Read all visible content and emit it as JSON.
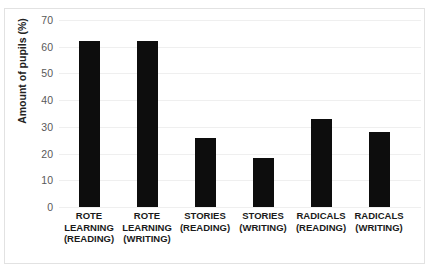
{
  "chart_data": {
    "type": "bar",
    "title": "",
    "xlabel": "",
    "ylabel": "Amount of pupils (%)",
    "ylim": [
      0,
      70
    ],
    "grid": true,
    "legend": "none",
    "bar_color": "#0d0d0d",
    "categories": [
      "ROTE\nLEARNING\n(READING)",
      "ROTE\nLEARNING\n(WRITING)",
      "STORIES\n(READING)",
      "STORIES\n(WRITING)",
      "RADICALS\n(READING)",
      "RADICALS\n(WRITING)"
    ],
    "values": [
      62,
      62,
      26,
      18.5,
      33,
      28
    ],
    "yticks": [
      {
        "value": 70,
        "label": "70"
      },
      {
        "value": 60,
        "label": "60"
      },
      {
        "value": 50,
        "label": "50"
      },
      {
        "value": 40,
        "label": "40"
      },
      {
        "value": 30,
        "label": "30"
      },
      {
        "value": 20,
        "label": "20"
      },
      {
        "value": 10,
        "label": "10"
      },
      {
        "value": 0,
        "label": "0"
      }
    ]
  }
}
